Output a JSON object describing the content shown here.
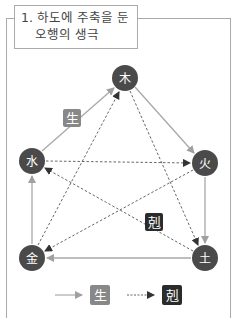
{
  "title": {
    "line1": "1. 하도에 주축을 둔",
    "line2": "오행의 생극"
  },
  "nodes": [
    {
      "id": "wood",
      "label": "木",
      "x": 125,
      "y": 78
    },
    {
      "id": "fire",
      "label": "火",
      "x": 205,
      "y": 163
    },
    {
      "id": "earth",
      "label": "土",
      "x": 205,
      "y": 258
    },
    {
      "id": "metal",
      "label": "金",
      "x": 32,
      "y": 258
    },
    {
      "id": "water",
      "label": "水",
      "x": 32,
      "y": 161
    }
  ],
  "badges": {
    "generate": {
      "label": "生",
      "color": "#888888"
    },
    "control": {
      "label": "剋",
      "color": "#2b2b2b"
    }
  },
  "legend": {
    "generate_label": "生",
    "control_label": "剋"
  },
  "colors": {
    "node": "#4a4a4a",
    "solid_arrow": "#a8a8a8",
    "dashed_arrow": "#555555",
    "frame": "#aaaaaa"
  }
}
